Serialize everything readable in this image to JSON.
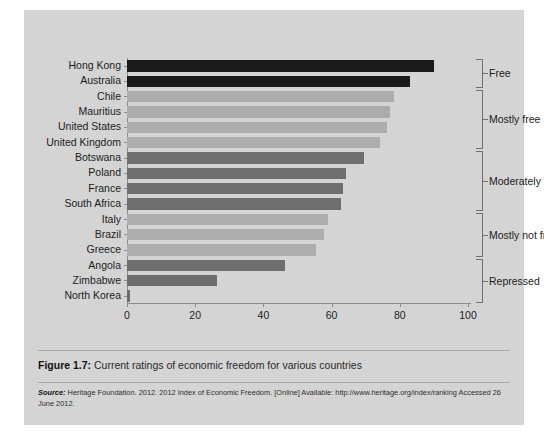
{
  "figure": {
    "caption_number": "Figure 1.7:",
    "caption_text": " Current ratings of economic freedom for various countries",
    "source_label": "Source:",
    "source_text": " Heritage Foundation. 2012. 2012 Index of Economic Freedom. [Online] Available: http://www.heritage.org/index/ranking Accessed 26 June 2012."
  },
  "colors": {
    "panel_background": "#d4d4d4",
    "free": "#1a1a1a",
    "mostly_free": "#adadad",
    "moderately_free": "#6e6e6e",
    "mostly_not_free": "#adadad",
    "repressed": "#6e6e6e",
    "axis": "#8c8c8c"
  },
  "chart_data": {
    "type": "bar",
    "orientation": "horizontal",
    "title": "",
    "xlabel": "",
    "ylabel": "",
    "xlim": [
      0,
      100
    ],
    "xticks": [
      0,
      20,
      40,
      60,
      80,
      100
    ],
    "grid": false,
    "legend": "none",
    "categories": [
      "Hong Kong",
      "Australia",
      "Chile",
      "Mauritius",
      "United States",
      "United Kingdom",
      "Botswana",
      "Poland",
      "France",
      "South Africa",
      "Italy",
      "Brazil",
      "Greece",
      "Angola",
      "Zimbabwe",
      "North Korea"
    ],
    "values": [
      89.9,
      83.1,
      78.3,
      77.0,
      76.3,
      74.1,
      69.6,
      64.2,
      63.2,
      62.7,
      58.8,
      57.9,
      55.4,
      46.2,
      26.3,
      1.0
    ],
    "bar_groups": [
      "free",
      "free",
      "mostly_free",
      "mostly_free",
      "mostly_free",
      "mostly_free",
      "moderately_free",
      "moderately_free",
      "moderately_free",
      "moderately_free",
      "mostly_not_free",
      "mostly_not_free",
      "mostly_not_free",
      "repressed",
      "repressed",
      "repressed"
    ],
    "groups": [
      {
        "label": "Free",
        "first": 0,
        "last": 1
      },
      {
        "label": "Mostly free",
        "first": 2,
        "last": 5
      },
      {
        "label": "Moderately free",
        "first": 6,
        "last": 9
      },
      {
        "label": "Mostly not free",
        "first": 10,
        "last": 12
      },
      {
        "label": "Repressed",
        "first": 13,
        "last": 15
      }
    ]
  }
}
